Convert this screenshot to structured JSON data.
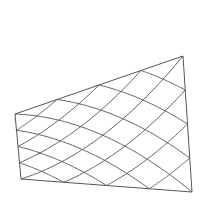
{
  "diagram": {
    "type": "warped-diagonal-grid",
    "background": "#ffffff",
    "stroke_color": "#555555",
    "corners": {
      "top_left": [
        15,
        114
      ],
      "top_right": [
        183,
        56
      ],
      "bottom_right": [
        192,
        192
      ],
      "bottom_left": [
        21,
        179
      ]
    },
    "divisions": 4
  }
}
